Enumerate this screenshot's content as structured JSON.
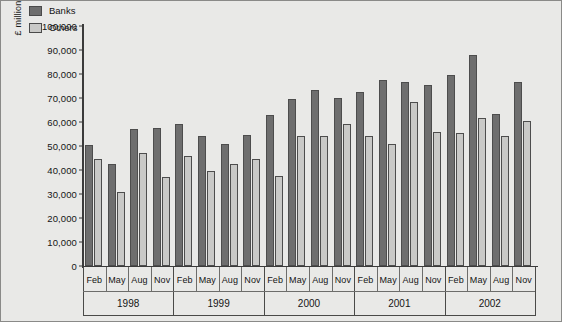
{
  "chart_data": {
    "type": "bar",
    "title": "",
    "xlabel": "",
    "ylabel": "£ million",
    "ylim": [
      0,
      100000
    ],
    "ytick_labels": [
      "100,000",
      "90,000",
      "80,000",
      "70,000",
      "60,000",
      "50,000",
      "40,000",
      "30,000",
      "20,000",
      "10,000",
      "0"
    ],
    "ytick_values": [
      100000,
      90000,
      80000,
      70000,
      60000,
      50000,
      40000,
      30000,
      20000,
      10000,
      0
    ],
    "grid": false,
    "legend_position": "top-left",
    "categories": [
      "Feb 1998",
      "May 1998",
      "Aug 1998",
      "Nov 1998",
      "Feb 1999",
      "May 1999",
      "Aug 1999",
      "Nov 1999",
      "Feb 2000",
      "May 2000",
      "Aug 2000",
      "Nov 2000",
      "Feb 2001",
      "May 2001",
      "Aug 2001",
      "Nov 2001",
      "Feb 2002",
      "May 2002",
      "Aug 2002",
      "Nov 2002"
    ],
    "months": [
      "Feb",
      "May",
      "Aug",
      "Nov",
      "Feb",
      "May",
      "Aug",
      "Nov",
      "Feb",
      "May",
      "Aug",
      "Nov",
      "Feb",
      "May",
      "Aug",
      "Nov",
      "Feb",
      "May",
      "Aug",
      "Nov"
    ],
    "years": [
      "1998",
      "1999",
      "2000",
      "2001",
      "2002"
    ],
    "series": [
      {
        "name": "Banks",
        "color": "#6e6e6e",
        "values": [
          50500,
          42500,
          57000,
          57500,
          59000,
          54000,
          51000,
          54500,
          63000,
          69500,
          73500,
          70000,
          72500,
          77500,
          76500,
          75500,
          79500,
          88000,
          63500,
          76500
        ]
      },
      {
        "name": "Others",
        "color": "#c9c9c7",
        "values": [
          44500,
          31000,
          47000,
          37000,
          46000,
          39500,
          42500,
          44500,
          37500,
          54000,
          54000,
          59000,
          54000,
          51000,
          68500,
          56000,
          55500,
          61500,
          54000,
          60500
        ]
      }
    ]
  },
  "legend": {
    "items": [
      {
        "label": "Banks",
        "swatch_class": "sw-banks"
      },
      {
        "label": "Others",
        "swatch_class": "sw-others"
      }
    ]
  },
  "colors": {
    "background": "#e9e9e7",
    "banks": "#6e6e6e",
    "others": "#c9c9c7",
    "axis": "#3b3b3b",
    "text": "#151515"
  }
}
